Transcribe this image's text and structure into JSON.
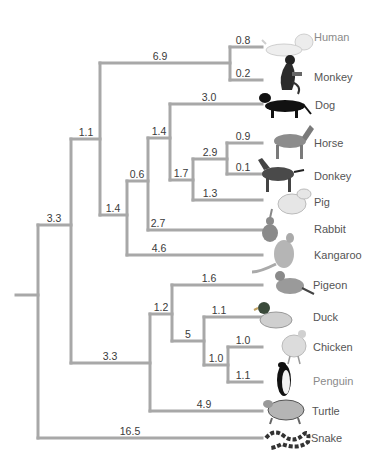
{
  "diagram": {
    "type": "phylogenetic-tree",
    "line_color": "#a8a8a8",
    "taxa": [
      {
        "name": "Human",
        "icon": "human-icon",
        "y": 47,
        "branch": "0.8",
        "light": true
      },
      {
        "name": "Monkey",
        "icon": "monkey-icon",
        "y": 80,
        "branch": "0.2",
        "light": false
      },
      {
        "name": "Dog",
        "icon": "dog-icon",
        "y": 104,
        "branch": "3.0",
        "light": false
      },
      {
        "name": "Horse",
        "icon": "horse-icon",
        "y": 143,
        "branch": "0.9",
        "light": false
      },
      {
        "name": "Donkey",
        "icon": "donkey-icon",
        "y": 174,
        "branch": "0.1",
        "light": false
      },
      {
        "name": "Pig",
        "icon": "pig-icon",
        "y": 200,
        "branch": "1.3",
        "light": false
      },
      {
        "name": "Rabbit",
        "icon": "rabbit-icon",
        "y": 230,
        "branch": "2.7",
        "light": false
      },
      {
        "name": "Kangaroo",
        "icon": "kangaroo-icon",
        "y": 255,
        "branch": "4.6",
        "light": false
      },
      {
        "name": "Pigeon",
        "icon": "pigeon-icon",
        "y": 285,
        "branch": "1.6",
        "light": false
      },
      {
        "name": "Duck",
        "icon": "duck-icon",
        "y": 317,
        "branch": "1.1",
        "light": false
      },
      {
        "name": "Chicken",
        "icon": "chicken-icon",
        "y": 347,
        "branch": "1.0",
        "light": false
      },
      {
        "name": "Penguin",
        "icon": "penguin-icon",
        "y": 382,
        "branch": "1.1",
        "light": true
      },
      {
        "name": "Turtle",
        "icon": "turtle-icon",
        "y": 411,
        "branch": "4.9",
        "light": false
      },
      {
        "name": "Snake",
        "icon": "snake-icon",
        "y": 438,
        "branch": "16.5",
        "light": false
      }
    ],
    "internal_branches": [
      {
        "label": "3.3",
        "x": 54,
        "y": 225,
        "desc": "root to amniote-non-snake"
      },
      {
        "label": "1.1",
        "x": 86,
        "y": 139,
        "desc": "to mammals"
      },
      {
        "label": "6.9",
        "x": 160,
        "y": 63,
        "desc": "to primates"
      },
      {
        "label": "1.4",
        "x": 113,
        "y": 215,
        "desc": "to placental non-primates"
      },
      {
        "label": "0.6",
        "x": 137,
        "y": 181,
        "desc": "to dog/ungulates/rabbit"
      },
      {
        "label": "1.4",
        "x": 159,
        "y": 138,
        "desc": "to dog/ungulates"
      },
      {
        "label": "1.7",
        "x": 181,
        "y": 180,
        "desc": "to ungulates"
      },
      {
        "label": "2.9",
        "x": 210,
        "y": 159,
        "desc": "to horse/donkey"
      },
      {
        "label": "3.3",
        "x": 110,
        "y": 363,
        "desc": "to reptiles/birds"
      },
      {
        "label": "1.2",
        "x": 161,
        "y": 314,
        "desc": "to birds"
      },
      {
        "label": "5",
        "x": 188,
        "y": 341,
        "desc": "to duck/chicken/penguin"
      },
      {
        "label": "1.0",
        "x": 216,
        "y": 365,
        "desc": "to chicken/penguin"
      }
    ]
  }
}
